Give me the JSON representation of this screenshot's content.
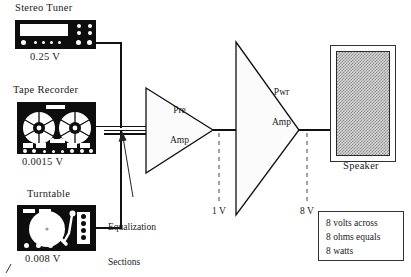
{
  "diagram": {
    "sources": [
      {
        "name": "Stereo Tuner",
        "voltage": "0.25 V",
        "icon": "tuner-icon"
      },
      {
        "name": "Tape Recorder",
        "voltage": "0.0015 V",
        "icon": "reel-to-reel-icon"
      },
      {
        "name": "Turntable",
        "voltage": "0.008 V",
        "icon": "turntable-icon"
      }
    ],
    "amplifiers": [
      {
        "line1": "Pre",
        "line2": "Amp",
        "name": "Pre Amp"
      },
      {
        "line1": "Pwr",
        "line2": "Amp",
        "name": "Pwr Amp"
      }
    ],
    "stage_voltages": [
      {
        "label": "1 V"
      },
      {
        "label": "8 V"
      }
    ],
    "annotation": {
      "line1": "Equalization",
      "line2": "Sections"
    },
    "speaker": {
      "label": "Speaker"
    },
    "note": {
      "line1": "8 volts across",
      "line2": "8 ohms equals",
      "line3": "8 watts"
    },
    "colors": {
      "ink": "#111111",
      "device": "#0d0d0d",
      "grille": "#8d8d8d",
      "paper": "#ffffff"
    }
  }
}
